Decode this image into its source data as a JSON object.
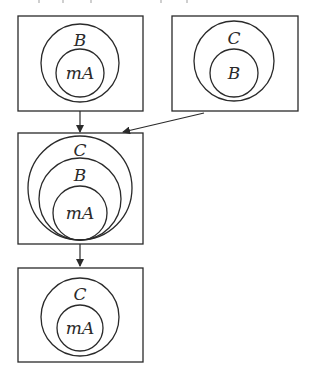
{
  "diagram": {
    "type": "set-inclusion-flow",
    "colors": {
      "stroke": "#2a2a2a",
      "background": "#ffffff"
    },
    "nodes": [
      {
        "id": "n1",
        "sets": [
          {
            "label": "B",
            "level": "outer"
          },
          {
            "label": "mA",
            "level": "inner"
          }
        ]
      },
      {
        "id": "n2",
        "sets": [
          {
            "label": "C",
            "level": "outer"
          },
          {
            "label": "B",
            "level": "inner"
          }
        ]
      },
      {
        "id": "n3",
        "sets": [
          {
            "label": "C",
            "level": "outer"
          },
          {
            "label": "B",
            "level": "middle"
          },
          {
            "label": "mA",
            "level": "inner"
          }
        ]
      },
      {
        "id": "n4",
        "sets": [
          {
            "label": "C",
            "level": "outer"
          },
          {
            "label": "mA",
            "level": "inner"
          }
        ]
      }
    ],
    "edges": [
      {
        "from": "n1",
        "to": "n3"
      },
      {
        "from": "n2",
        "to": "n3"
      },
      {
        "from": "n3",
        "to": "n4"
      }
    ]
  }
}
